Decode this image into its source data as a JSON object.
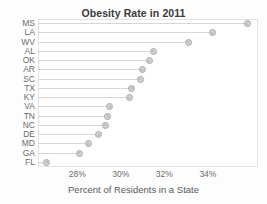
{
  "chart_data": {
    "type": "bar",
    "subtype": "lollipop-horizontal",
    "title": "Obesity Rate in 2011",
    "xlabel": "Percent of Residents in a State",
    "ylabel": "",
    "categories": [
      "MS",
      "LA",
      "WV",
      "AL",
      "OK",
      "AR",
      "SC",
      "TX",
      "KY",
      "VA",
      "TN",
      "NC",
      "DE",
      "MD",
      "GA",
      "FL"
    ],
    "values": [
      35.8,
      34.2,
      33.1,
      31.5,
      31.3,
      31.0,
      30.9,
      30.5,
      30.4,
      29.5,
      29.4,
      29.3,
      29.0,
      28.5,
      28.1,
      26.6
    ],
    "xlim": [
      26.2,
      36.3
    ],
    "xticks": [
      28,
      30,
      32,
      34
    ],
    "xticklabels": [
      "28%",
      "30%",
      "32%",
      "34%"
    ],
    "grid": false,
    "legend": null,
    "marker_fill": "#d2d2d2",
    "marker_edge": "#a9a9a9",
    "line_color": "#d6d6d6",
    "frame_color": "#e2e2e2",
    "text_color": "#6b6b6b",
    "title_color": "#3a3a3a"
  }
}
